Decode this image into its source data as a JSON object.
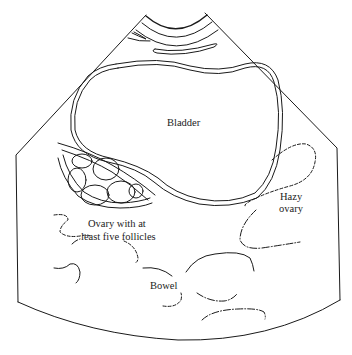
{
  "diagram": {
    "type": "ultrasound-schematic",
    "labels": {
      "bladder": "Bladder",
      "ovary_line1": "Ovary with at",
      "ovary_line2": "least five follicles",
      "hazy_line1": "Hazy",
      "hazy_line2": "ovary",
      "bowel": "Bowel"
    },
    "colors": {
      "line": "#1a1a1a",
      "text": "#222222",
      "background": "#ffffff"
    }
  }
}
